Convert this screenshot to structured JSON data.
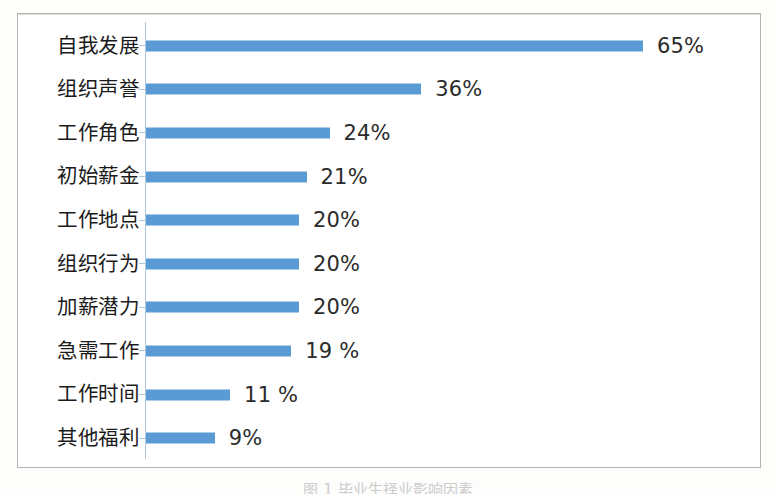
{
  "chart_data": {
    "type": "bar",
    "orientation": "horizontal",
    "title": "",
    "xlabel": "",
    "ylabel": "",
    "xlim": [
      0,
      70
    ],
    "grid": false,
    "legend": false,
    "categories": [
      "自我发展",
      "组织声誉",
      "工作角色",
      "初始薪金",
      "工作地点",
      "组织行为",
      "加薪潜力",
      "急需工作",
      "工作时间",
      "其他福利"
    ],
    "values": [
      65,
      36,
      24,
      21,
      20,
      20,
      20,
      19,
      11,
      9
    ],
    "data_labels": [
      "65%",
      "36%",
      "24%",
      "21%",
      "20%",
      "20%",
      "20%",
      "19 %",
      "11 %",
      "9%"
    ],
    "series_color": "#5b9bd5",
    "axis_color": "#aac8e0",
    "frame_color": "#b4b4b0",
    "background": "#ffffff"
  },
  "caption": {
    "text": "图 1  毕业生择业影响因素"
  }
}
